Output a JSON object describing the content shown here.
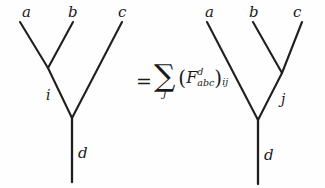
{
  "figure": {
    "background_color": "#fefefe",
    "line_color": "#1f1f1f",
    "text_color": "#1a1a1a",
    "width": 325,
    "height": 188
  },
  "left_tree": {
    "name": "left-fusion-tree",
    "leaves": [
      {
        "label": "a",
        "x": 22,
        "y": 5
      },
      {
        "label": "b",
        "x": 68,
        "y": 5
      },
      {
        "label": "c",
        "x": 118,
        "y": 5
      }
    ],
    "internal_label": {
      "label": "i",
      "x": 46,
      "y": 88
    },
    "root_label": {
      "label": "d",
      "x": 78,
      "y": 146
    },
    "edges": [
      {
        "name": "edge-a",
        "x1": 20,
        "y1": 22,
        "x2": 48,
        "y2": 68
      },
      {
        "name": "edge-b",
        "x1": 73,
        "y1": 22,
        "x2": 48,
        "y2": 68
      },
      {
        "name": "edge-i",
        "x1": 48,
        "y1": 68,
        "x2": 72,
        "y2": 118
      },
      {
        "name": "edge-c",
        "x1": 122,
        "y1": 22,
        "x2": 72,
        "y2": 118
      },
      {
        "name": "edge-d",
        "x1": 72,
        "y1": 118,
        "x2": 72,
        "y2": 182
      }
    ]
  },
  "right_tree": {
    "name": "right-fusion-tree",
    "leaves": [
      {
        "label": "a",
        "x": 205,
        "y": 5
      },
      {
        "label": "b",
        "x": 249,
        "y": 5
      },
      {
        "label": "c",
        "x": 293,
        "y": 5
      }
    ],
    "internal_label": {
      "label": "j",
      "x": 281,
      "y": 92
    },
    "root_label": {
      "label": "d",
      "x": 264,
      "y": 148
    },
    "edges": [
      {
        "name": "edge-a",
        "x1": 207,
        "y1": 22,
        "x2": 258,
        "y2": 120
      },
      {
        "name": "edge-b",
        "x1": 253,
        "y1": 22,
        "x2": 282,
        "y2": 73
      },
      {
        "name": "edge-c",
        "x1": 302,
        "y1": 22,
        "x2": 282,
        "y2": 73
      },
      {
        "name": "edge-j",
        "x1": 282,
        "y1": 73,
        "x2": 258,
        "y2": 120
      },
      {
        "name": "edge-d",
        "x1": 258,
        "y1": 120,
        "x2": 258,
        "y2": 184
      }
    ]
  },
  "equation": {
    "equals": "=",
    "sum_glyph": "∑",
    "sum_index": "j",
    "open_paren": "(",
    "close_paren": ")",
    "f_letter": "F",
    "f_superscript": "d",
    "f_subscript": "abc",
    "matrix_indices": "ij"
  }
}
